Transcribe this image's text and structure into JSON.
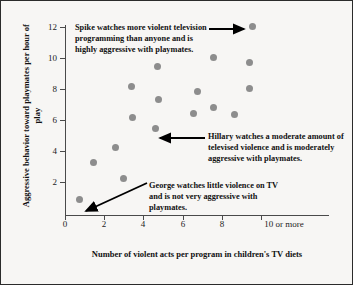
{
  "chart_data": {
    "type": "scatter",
    "title": "",
    "xlabel": "Number of violent acts per program in children's TV diets",
    "ylabel": "Aggressive behavior toward playmates per hour of play",
    "xlim": [
      0,
      10
    ],
    "ylim": [
      0,
      12.8
    ],
    "grid": false,
    "legend": "none",
    "xticks": [
      "0",
      "2",
      "4",
      "6",
      "8",
      "10 or more"
    ],
    "xtick_values": [
      0,
      2,
      4,
      6,
      8,
      10
    ],
    "yticks": [
      "2",
      "4",
      "6",
      "8",
      "10",
      "12"
    ],
    "ytick_values": [
      2,
      4,
      6,
      8,
      10,
      12
    ],
    "marker_color": "#8d8d8d",
    "points": [
      {
        "x": 0.75,
        "y": 0.85,
        "label": "George"
      },
      {
        "x": 1.45,
        "y": 3.25
      },
      {
        "x": 2.6,
        "y": 4.2
      },
      {
        "x": 3.0,
        "y": 2.2
      },
      {
        "x": 3.4,
        "y": 8.15
      },
      {
        "x": 3.45,
        "y": 6.15
      },
      {
        "x": 4.6,
        "y": 5.45,
        "label": "Hillary"
      },
      {
        "x": 4.7,
        "y": 9.45
      },
      {
        "x": 4.75,
        "y": 7.35
      },
      {
        "x": 6.55,
        "y": 6.4
      },
      {
        "x": 6.75,
        "y": 7.85
      },
      {
        "x": 7.6,
        "y": 10.05
      },
      {
        "x": 7.6,
        "y": 6.8
      },
      {
        "x": 8.65,
        "y": 6.35
      },
      {
        "x": 9.4,
        "y": 9.7
      },
      {
        "x": 9.4,
        "y": 8.05
      },
      {
        "x": 9.55,
        "y": 12.05,
        "label": "Spike"
      }
    ],
    "annotations": [
      {
        "name": "spike",
        "text": "Spike watches more violent television programming than anyone and is highly aggressive with playmates.",
        "points_to": {
          "x": 9.55,
          "y": 12.05
        }
      },
      {
        "name": "hillary",
        "text": "Hillary watches a moderate amount of televised violence and is moderately aggressive with playmates.",
        "points_to": {
          "x": 4.6,
          "y": 5.45
        }
      },
      {
        "name": "george",
        "text": "George watches little violence on TV and is not very aggressive with playmates.",
        "points_to": {
          "x": 0.75,
          "y": 0.85
        }
      }
    ]
  }
}
